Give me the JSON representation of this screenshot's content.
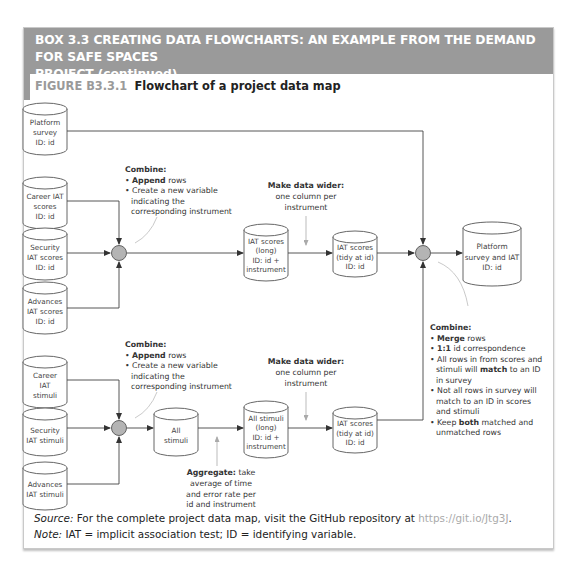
{
  "box": {
    "header_line1": "BOX 3.3  CREATING DATA FLOWCHARTS: AN EXAMPLE FROM THE DEMAND FOR SAFE SPACES",
    "header_line2": "PROJECT (continued)"
  },
  "figure": {
    "label": "FIGURE B3.3.1",
    "title": "Flowchart of a project data map"
  },
  "nodes": {
    "platform_survey": [
      "Platform",
      "survey",
      "ID: id"
    ],
    "career_iat_scores": [
      "Career IAT",
      "scores",
      "ID: id"
    ],
    "security_iat_scores": [
      "Security",
      "IAT scores",
      "ID: id"
    ],
    "advances_iat_scores": [
      "Advances",
      "IAT scores",
      "ID: id"
    ],
    "iat_scores_long": [
      "IAT scores",
      "(long)",
      "ID: id +",
      "instrument"
    ],
    "iat_scores_tidy_top": [
      "IAT scores",
      "(tidy at id)",
      "ID: id"
    ],
    "platform_survey_and_iat": [
      "Platform",
      "survey and IAT",
      "ID: id"
    ],
    "career_iat_stimuli": [
      "Career",
      "IAT",
      "stimuli"
    ],
    "security_iat_stimuli": [
      "Security",
      "IAT stimuli"
    ],
    "advances_iat_stimuli": [
      "Advances",
      "IAT stimuli"
    ],
    "all_stimuli": [
      "All",
      "stimuli"
    ],
    "all_stimuli_long": [
      "All stimuli",
      "(long)",
      "ID: id +",
      "instrument"
    ],
    "iat_scores_tidy_bottom": [
      "IAT scores",
      "(tidy at id)",
      "ID: id"
    ]
  },
  "annotations": {
    "combine_top": {
      "title": "Combine:",
      "bullets": [
        {
          "bold": "Append",
          "rest": " rows"
        },
        {
          "bold": "",
          "rest": "Create a new variable"
        },
        {
          "bold": "",
          "rest": "indicating the",
          "cont": true
        },
        {
          "bold": "",
          "rest": "corresponding instrument",
          "cont": true
        }
      ]
    },
    "wider_top": {
      "title": "Make data wider:",
      "lines": [
        "one column per",
        "instrument"
      ]
    },
    "combine_bottom": {
      "title": "Combine:",
      "bullets": [
        {
          "bold": "Append",
          "rest": " rows"
        },
        {
          "bold": "",
          "rest": "Create a new variable"
        },
        {
          "bold": "",
          "rest": "indicating the",
          "cont": true
        },
        {
          "bold": "",
          "rest": "corresponding instrument",
          "cont": true
        }
      ]
    },
    "wider_bottom": {
      "title": "Make data wider:",
      "lines": [
        "one column per",
        "instrument"
      ]
    },
    "aggregate": {
      "title": "Aggregate:",
      "title_rest": " take",
      "lines": [
        "average of time",
        "and error rate per",
        "id and instrument"
      ]
    },
    "merge": {
      "title": "Combine:",
      "bullets": [
        {
          "bold": "Merge",
          "rest": " rows"
        },
        {
          "bold": "1:1",
          "rest": " id correspondence"
        },
        {
          "pre": "All rows in from scores and",
          "bold": "",
          "rest": ""
        },
        {
          "pre": "stimuli will ",
          "bold": "match",
          "rest": " to an ID",
          "cont": true
        },
        {
          "pre": "in survey",
          "bold": "",
          "rest": "",
          "cont": true
        },
        {
          "pre": "Not all rows in survey will",
          "bold": "",
          "rest": ""
        },
        {
          "pre": "match to an ID in scores",
          "bold": "",
          "rest": "",
          "cont": true
        },
        {
          "pre": "and stimuli",
          "bold": "",
          "rest": "",
          "cont": true
        },
        {
          "pre": "Keep ",
          "bold": "both",
          "rest": " matched and"
        },
        {
          "pre": "unmatched rows",
          "bold": "",
          "rest": "",
          "cont": true
        }
      ]
    }
  },
  "footer": {
    "source_label": "Source:",
    "source_text": " For the complete project data map, visit the GitHub repository at ",
    "source_link": "https://git.io/Jtg3J",
    "source_end": ".",
    "note_label": "Note:",
    "note_text": " IAT = implicit association test; ID = identifying variable."
  },
  "colors": {
    "header_bg": "#9a9a9a",
    "circle_fill": "#b4b4b4",
    "line": "#444444",
    "callout": "#bbbbbb"
  }
}
